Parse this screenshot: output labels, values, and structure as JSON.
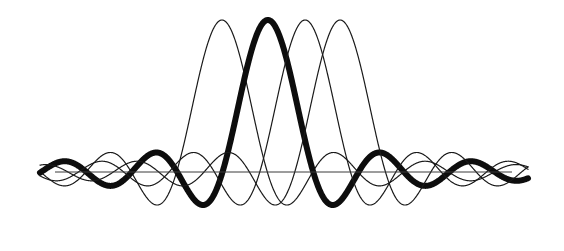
{
  "figure": {
    "background_color": "#ffffff",
    "width": 564,
    "height": 251
  },
  "chart_data": {
    "type": "line",
    "title": "",
    "subtitle": "",
    "xlabel": "",
    "ylabel": "",
    "grid": false,
    "legend": "none",
    "xlim": [
      -8.5,
      8.5
    ],
    "ylim": [
      -0.42,
      1.05
    ],
    "axis": {
      "show_x_axis": true,
      "x_axis_y_value": 0,
      "x_axis_pixel_y": 172,
      "x_axis_pixel_x_start": 55,
      "x_axis_pixel_x_end": 512,
      "axis_color": "#3a3a3a",
      "axis_width": 1.0
    },
    "geometry": {
      "center_pixel_x": 283,
      "baseline_pixel_y": 172,
      "pixels_per_unit_x": 28.0,
      "pixels_per_unit_y": 152.0,
      "curve_pixel_x_start": 40,
      "curve_pixel_x_end": 528,
      "peak_top_pixel_y": 18,
      "trough_bottom_pixel_y": 233
    },
    "series": [
      {
        "name": "carrier-1",
        "emphasis": "thin",
        "color": "#1a1a1a",
        "stroke_width": 1.2,
        "envelope": "sinc",
        "envelope_scale": 3.05,
        "carrier_frequency": 0.322,
        "phase_offset": 0.0,
        "amplitude": 1.0,
        "peak_pixel_x": 222,
        "peak_pixel_y": 20
      },
      {
        "name": "carrier-2",
        "emphasis": "thick",
        "color": "#0d0d0d",
        "stroke_width": 6.0,
        "envelope": "sinc",
        "envelope_scale": 3.05,
        "carrier_frequency": 0.322,
        "phase_offset": 0.0,
        "amplitude": 1.0,
        "peak_pixel_x": 268,
        "peak_pixel_y": 18
      },
      {
        "name": "carrier-3",
        "emphasis": "thin",
        "color": "#1a1a1a",
        "stroke_width": 1.2,
        "envelope": "sinc",
        "envelope_scale": 3.05,
        "carrier_frequency": 0.322,
        "phase_offset": 0.0,
        "amplitude": 1.0,
        "peak_pixel_x": 305,
        "peak_pixel_y": 20
      },
      {
        "name": "carrier-4",
        "emphasis": "thin",
        "color": "#1a1a1a",
        "stroke_width": 1.2,
        "envelope": "sinc",
        "envelope_scale": 3.05,
        "carrier_frequency": 0.322,
        "phase_offset": 0.0,
        "amplitude": 1.0,
        "peak_pixel_x": 340,
        "peak_pixel_y": 20
      }
    ],
    "series_centers_units": [
      -2.18,
      -0.54,
      0.79,
      2.04
    ],
    "main_lobe_peak_value": 1.0,
    "first_sidelobe_value": -0.217,
    "second_sidelobe_value": 0.128,
    "third_sidelobe_value": -0.091,
    "sample_x_units": [
      -8.5,
      -7,
      -6,
      -5,
      -4,
      -3,
      -2,
      -1,
      0,
      1,
      2,
      3,
      4,
      5,
      6,
      7,
      8.5
    ],
    "sample_y_units_thick": [
      0.03,
      -0.09,
      0.13,
      -0.22,
      0.33,
      -0.55,
      0.78,
      -0.95,
      1.0,
      -0.95,
      0.78,
      -0.55,
      0.33,
      -0.22,
      0.13,
      -0.09,
      0.03
    ]
  }
}
